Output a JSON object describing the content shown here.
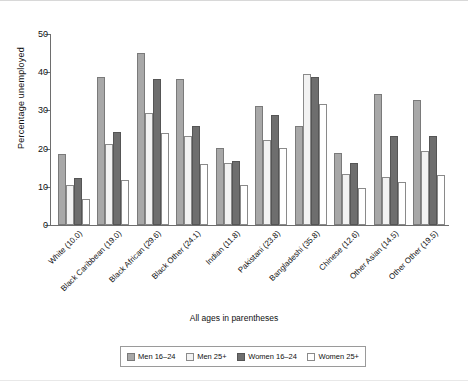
{
  "chart_data": {
    "type": "bar",
    "title": "",
    "xlabel": "All ages in parentheses",
    "ylabel": "Percentage unemployed",
    "ylim": [
      0,
      50
    ],
    "yticks": [
      0,
      10,
      20,
      30,
      40,
      50
    ],
    "ytick_labels": [
      "0",
      "10",
      "20",
      "30",
      "40",
      "50"
    ],
    "grid": false,
    "legend_position": "bottom",
    "categories": [
      "White (10.0)",
      "Black Caribbean (19.0)",
      "Black African (29.6)",
      "Black Other (24.1)",
      "Indian (11.8)",
      "Pakistani (23.8)",
      "Bangladeshi (35.8)",
      "Chinese (12.6)",
      "Other Asian (14.5)",
      "Other Other (19.5)"
    ],
    "series": [
      {
        "name": "Men 16–24",
        "color": "#a8a8a8",
        "values": [
          18.7,
          38.7,
          45.0,
          38.3,
          20.2,
          31.2,
          26.0,
          18.8,
          34.3,
          32.7
        ]
      },
      {
        "name": "Men 25+",
        "color": "#f2f2f2",
        "values": [
          10.5,
          21.2,
          29.2,
          23.2,
          16.3,
          22.3,
          39.5,
          13.3,
          12.5,
          19.5
        ]
      },
      {
        "name": "Women 16–24",
        "color": "#6e6e6e",
        "values": [
          12.2,
          24.3,
          38.3,
          26.0,
          16.8,
          28.8,
          38.7,
          16.3,
          23.2,
          23.2
        ]
      },
      {
        "name": "Women 25+",
        "color": "#ffffff",
        "values": [
          6.8,
          11.7,
          24.0,
          16.0,
          10.5,
          20.2,
          31.7,
          9.8,
          11.3,
          13.2
        ]
      }
    ]
  }
}
